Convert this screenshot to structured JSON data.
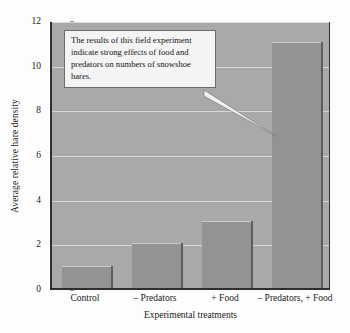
{
  "chart_data": {
    "type": "bar",
    "title": "",
    "xlabel": "Experimental treatments",
    "ylabel": "Average relative hare density",
    "categories": [
      "Control",
      "– Predators",
      "+ Food",
      "– Predators, + Food"
    ],
    "values": [
      1,
      2,
      3,
      11
    ],
    "ylim": [
      0,
      12
    ],
    "ytick_labels": [
      "0",
      "2",
      "4",
      "6",
      "8",
      "10",
      "12"
    ],
    "ytick_values": [
      0,
      2,
      4,
      6,
      8,
      10,
      12
    ],
    "grid": true,
    "legend": "none",
    "annotations": [
      {
        "name": "callout",
        "text": "The results of this field experiment indicate strong effects of food and predators on numbers of snowshoe hares.",
        "points_to_category": "– Predators, + Food"
      }
    ],
    "colors": {
      "plot_background": "#a9a9a9",
      "bar_fill": "#939393",
      "bar_edge": "#5d5d5d",
      "gridline": "#d8d8d8",
      "axis": "#2e2e2e",
      "callout_background": "#f4f4f4",
      "callout_border": "#6d6d6d",
      "text": "#1a1a1a",
      "page_background": "#fdfdfd"
    }
  }
}
